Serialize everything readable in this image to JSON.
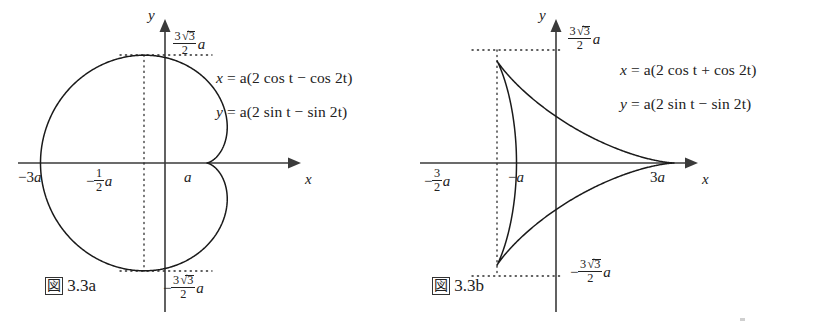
{
  "figure": {
    "background_color": "#ffffff",
    "curve_color": "#1a1a1a",
    "axis_color": "#3a3a3a",
    "guide_color": "#2b2b2b"
  },
  "panels": [
    {
      "id": "panel-a",
      "caption_symbol": "図",
      "caption_number": "3.3a",
      "axis_x_label": "x",
      "axis_y_label": "y",
      "equations": [
        {
          "lhs": "x",
          "rhs": "= a(2 cos t − cos 2t)"
        },
        {
          "lhs": "y",
          "rhs": "= a(2 sin t − sin 2t)"
        }
      ],
      "ticks": [
        {
          "name": "x-min",
          "text": "−3a",
          "value": -3
        },
        {
          "name": "x-half",
          "text": "−½a",
          "value": -0.5
        },
        {
          "name": "x-cusp",
          "text": "a",
          "value": 1
        },
        {
          "name": "y-max",
          "text": "3√3/2 a",
          "value": 2.598
        },
        {
          "name": "y-min",
          "text": "−3√3/2 a",
          "value": -2.598
        }
      ],
      "chart_data": {
        "type": "line",
        "title": "図 3.3a",
        "curve_name": "cardioid",
        "parametric": {
          "x": "a(2cos t - cos 2t)",
          "y": "a(2sin t - sin 2t)",
          "t_range": [
            0,
            6.283185307179586
          ],
          "a": 1
        },
        "xlabel": "x",
        "ylabel": "y",
        "xlim": [
          -3,
          1
        ],
        "ylim": [
          -2.598,
          2.598
        ],
        "grid": false,
        "annotations": [
          "−3a",
          "−½a",
          "a",
          "3√3/2 a",
          "−3√3/2 a"
        ],
        "key_points": [
          {
            "label": "cusp",
            "x": 1,
            "y": 0
          },
          {
            "label": "leftmost",
            "x": -3,
            "y": 0
          },
          {
            "label": "top",
            "x": -0.5,
            "y": 2.598
          },
          {
            "label": "bottom",
            "x": -0.5,
            "y": -2.598
          }
        ]
      }
    },
    {
      "id": "panel-b",
      "caption_symbol": "図",
      "caption_number": "3.3b",
      "axis_x_label": "x",
      "axis_y_label": "y",
      "equations": [
        {
          "lhs": "x",
          "rhs": "= a(2 cos t + cos 2t)"
        },
        {
          "lhs": "y",
          "rhs": "= a(2 sin t − sin 2t)"
        }
      ],
      "ticks": [
        {
          "name": "x-cusp-left",
          "text": "−3/2 a",
          "value": -1.5
        },
        {
          "name": "x-neg-a",
          "text": "−a",
          "value": -1
        },
        {
          "name": "x-cusp-right",
          "text": "3a",
          "value": 3
        },
        {
          "name": "y-max",
          "text": "3√3/2 a",
          "value": 2.598
        },
        {
          "name": "y-min",
          "text": "−3√3/2 a",
          "value": -2.598
        }
      ],
      "chart_data": {
        "type": "line",
        "title": "図 3.3b",
        "curve_name": "deltoid",
        "parametric": {
          "x": "a(2cos t + cos 2t)",
          "y": "a(2sin t - sin 2t)",
          "t_range": [
            0,
            6.283185307179586
          ],
          "a": 1
        },
        "xlabel": "x",
        "ylabel": "y",
        "xlim": [
          -1.5,
          3
        ],
        "ylim": [
          -2.598,
          2.598
        ],
        "grid": false,
        "annotations": [
          "−3/2 a",
          "−a",
          "3a",
          "3√3/2 a",
          "−3√3/2 a"
        ],
        "key_points": [
          {
            "label": "cusp-right",
            "x": 3,
            "y": 0
          },
          {
            "label": "cusp-upper-left",
            "x": -1.5,
            "y": 2.598
          },
          {
            "label": "cusp-lower-left",
            "x": -1.5,
            "y": -2.598
          }
        ]
      }
    }
  ],
  "geometry": {
    "panel_a": {
      "origin_x": 165,
      "origin_y": 163,
      "scale": 41.5
    },
    "panel_b": {
      "origin_x": 146,
      "origin_y": 163,
      "scale": 39.5
    }
  }
}
